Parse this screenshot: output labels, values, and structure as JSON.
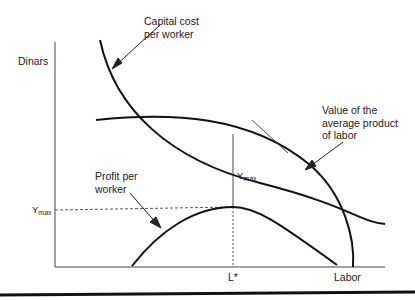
{
  "axes": {
    "y_label": "Dinars",
    "x_label": "Labor",
    "x_marker": "L*",
    "y_marker_main": "Y",
    "y_marker_sub": "max"
  },
  "annotations": {
    "capital_cost_line1": "Capital cost",
    "capital_cost_line2": "per worker",
    "vapl_line1": "Value of the",
    "vapl_line2": "average product",
    "vapl_line3": "of labor",
    "profit_line1": "Profit per",
    "profit_line2": "worker",
    "gap_main": "Y",
    "gap_sub": "max"
  },
  "curves": [
    {
      "name": "Capital cost per worker",
      "shape": "downward-sloping convex, falls then flattens"
    },
    {
      "name": "Value of the average product of labor",
      "shape": "concave, falls steeply to zero near Labor axis end"
    },
    {
      "name": "Profit per worker",
      "shape": "inverted U, peaks at L* with height Ymax"
    }
  ]
}
